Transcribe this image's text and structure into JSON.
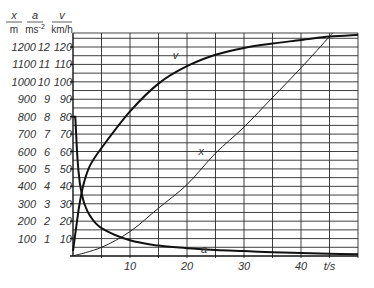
{
  "chart_data": {
    "type": "line",
    "title": "",
    "xlabel": "t/s",
    "ylabels": [
      {
        "symbol": "x",
        "unit": "m"
      },
      {
        "symbol": "a",
        "unit": "ms-2"
      },
      {
        "symbol": "v",
        "unit": "km/h"
      }
    ],
    "xlim": [
      0,
      50
    ],
    "ylim_scaled": [
      0,
      128
    ],
    "x_ticks": [
      "10",
      "20",
      "30",
      "40"
    ],
    "y_ticks": {
      "x_m": [
        "100",
        "200",
        "300",
        "400",
        "500",
        "600",
        "700",
        "800",
        "900",
        "1000",
        "1100",
        "1200"
      ],
      "a_ms2": [
        "1",
        "2",
        "3",
        "4",
        "5",
        "6",
        "7",
        "8",
        "9",
        "10",
        "11",
        "12"
      ],
      "v_kmh": [
        "10",
        "20",
        "30",
        "40",
        "50",
        "60",
        "70",
        "80",
        "90",
        "100",
        "110",
        "120"
      ]
    },
    "grid": true,
    "series": [
      {
        "name": "v",
        "unit": "km/h",
        "t": [
          0,
          0.5,
          1,
          1.5,
          2,
          3,
          5,
          10,
          15,
          20,
          25,
          30,
          35,
          40,
          45,
          50
        ],
        "values": [
          3,
          15,
          27,
          36,
          43,
          52,
          62,
          83,
          99,
          109,
          115.5,
          119.5,
          122,
          124,
          126,
          127
        ]
      },
      {
        "name": "a",
        "unit": "ms-2",
        "t": [
          0,
          0.4,
          0.8,
          1.2,
          1.6,
          2,
          3,
          5,
          10,
          15,
          20,
          25,
          30,
          35,
          40,
          45,
          50
        ],
        "values": [
          8,
          8,
          5.5,
          4.2,
          3.5,
          3.0,
          2.3,
          1.6,
          0.9,
          0.6,
          0.45,
          0.35,
          0.28,
          0.22,
          0.17,
          0.13,
          0.1
        ]
      },
      {
        "name": "x",
        "unit": "m",
        "t": [
          0,
          5,
          10,
          15,
          20,
          25,
          30,
          35,
          40,
          45,
          45.5
        ],
        "values": [
          0,
          50,
          140,
          275,
          410,
          590,
          740,
          910,
          1080,
          1260,
          1280
        ]
      }
    ],
    "curve_labels": [
      {
        "text": "v",
        "t": 18,
        "value": 113
      },
      {
        "text": "x",
        "t": 22.5,
        "value": 58
      },
      {
        "text": "a",
        "t": 23,
        "value": 2
      }
    ]
  }
}
